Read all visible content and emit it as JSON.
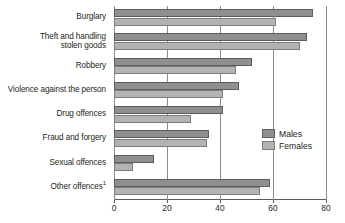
{
  "chart_data": {
    "type": "bar",
    "orientation": "horizontal",
    "title": "",
    "xlabel": "",
    "ylabel": "",
    "xlim": [
      0,
      80
    ],
    "xticks": [
      0,
      20,
      40,
      60,
      80
    ],
    "grid": true,
    "legend_position": "right",
    "categories": [
      "Burglary",
      "Theft and handling\nstolen goods",
      "Robbery",
      "Violence against the person",
      "Drug offences",
      "Fraud and forgery",
      "Sexual offences",
      "Other offences"
    ],
    "category_footnotes": {
      "Other offences": "1"
    },
    "series": [
      {
        "name": "Males",
        "color": "#8f8f8f",
        "values": [
          75,
          73,
          52,
          47,
          41,
          36,
          15,
          59
        ]
      },
      {
        "name": "Females",
        "color": "#b3b3b3",
        "values": [
          61,
          70,
          46,
          41,
          29,
          35,
          7,
          55
        ]
      }
    ]
  },
  "legend": {
    "items": [
      {
        "label": "Males"
      },
      {
        "label": "Females"
      }
    ]
  },
  "axis": {
    "tick_labels": [
      "0",
      "20",
      "40",
      "60",
      "80"
    ]
  }
}
